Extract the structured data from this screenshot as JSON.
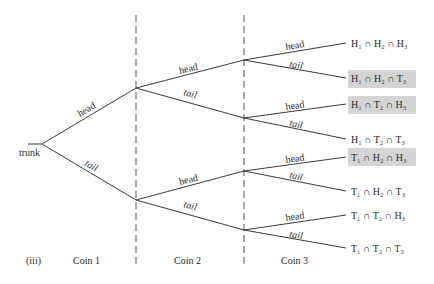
{
  "diagram": {
    "type": "probability-tree",
    "panel_label": "(iii)",
    "root_label": "trunk",
    "column_labels": [
      "Coin 1",
      "Coin 2",
      "Coin 3"
    ],
    "branch_labels": {
      "coin1": [
        "head",
        "tail"
      ],
      "coin2": [
        "head",
        "tail",
        "head",
        "tail"
      ],
      "coin3": [
        "head",
        "tail",
        "head",
        "tail",
        "head",
        "tail",
        "head",
        "tail"
      ]
    },
    "outcomes": [
      {
        "text": "H₁ ∩ H₂ ∩ H₃",
        "highlighted": false
      },
      {
        "text": "H₁ ∩ H₂ ∩ T₃",
        "highlighted": true
      },
      {
        "text": "H₁ ∩ T₂ ∩ H₃",
        "highlighted": true
      },
      {
        "text": "H₁ ∩ T₂ ∩ T₃",
        "highlighted": false
      },
      {
        "text": "T₁ ∩ H₂ ∩ H₃",
        "highlighted": true
      },
      {
        "text": "T₁ ∩ H₂ ∩ T₃",
        "highlighted": false
      },
      {
        "text": "T₁ ∩ T₂ ∩ H₃",
        "highlighted": false
      },
      {
        "text": "T₁ ∩ T₂ ∩ T₃",
        "highlighted": false
      }
    ],
    "highlight_color": "#d4d4d4"
  }
}
